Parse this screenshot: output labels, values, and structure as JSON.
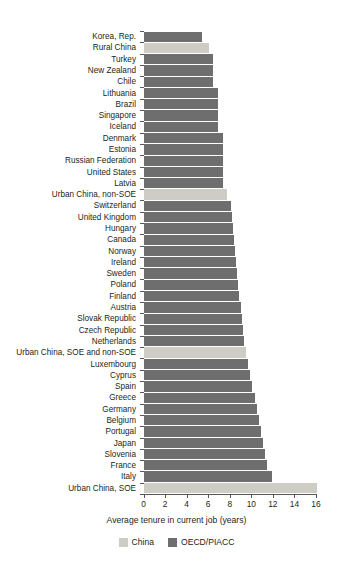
{
  "chart_data": {
    "type": "bar",
    "orientation": "horizontal",
    "title": "",
    "subtitle": "",
    "xlabel": "Average tenure in current job (years)",
    "ylabel": "",
    "xlim": [
      0,
      16.8
    ],
    "xticks": [
      0,
      2,
      4,
      6,
      8,
      10,
      12,
      14,
      16
    ],
    "xtick_labels": [
      "0",
      "2",
      "4",
      "6",
      "8",
      "10",
      "12",
      "14",
      "16"
    ],
    "grid": false,
    "legend_position": "bottom",
    "legend": [
      {
        "name": "China",
        "color": "#cdcdc6"
      },
      {
        "name": "OECD/PIACC",
        "color": "#6e6e6e"
      }
    ],
    "categories": [
      "Korea, Rep.",
      "Rural China",
      "Turkey",
      "New Zealand",
      "Chile",
      "Lithuania",
      "Brazil",
      "Singapore",
      "Iceland",
      "Denmark",
      "Estonia",
      "Russian Federation",
      "United States",
      "Latvia",
      "Urban China, non-SOE",
      "Switzerland",
      "United Kingdom",
      "Hungary",
      "Canada",
      "Norway",
      "Ireland",
      "Sweden",
      "Poland",
      "Finland",
      "Austria",
      "Slovak Republic",
      "Czech Republic",
      "Netherlands",
      "Urban China, SOE and non-SOE",
      "Luxembourg",
      "Cyprus",
      "Spain",
      "Greece",
      "Germany",
      "Belgium",
      "Portugal",
      "Japan",
      "Slovenia",
      "France",
      "Italy",
      "Urban China, SOE"
    ],
    "values": [
      5.4,
      6.1,
      6.4,
      6.4,
      6.4,
      6.9,
      6.9,
      6.9,
      6.9,
      7.4,
      7.4,
      7.4,
      7.4,
      7.4,
      7.7,
      8.1,
      8.2,
      8.3,
      8.4,
      8.5,
      8.6,
      8.7,
      8.8,
      8.9,
      9.0,
      9.1,
      9.2,
      9.3,
      9.5,
      9.7,
      9.9,
      10.1,
      10.3,
      10.5,
      10.7,
      10.9,
      11.1,
      11.3,
      11.5,
      11.9,
      16.1
    ],
    "series_of": [
      "OECD/PIACC",
      "China",
      "OECD/PIACC",
      "OECD/PIACC",
      "OECD/PIACC",
      "OECD/PIACC",
      "OECD/PIACC",
      "OECD/PIACC",
      "OECD/PIACC",
      "OECD/PIACC",
      "OECD/PIACC",
      "OECD/PIACC",
      "OECD/PIACC",
      "OECD/PIACC",
      "China",
      "OECD/PIACC",
      "OECD/PIACC",
      "OECD/PIACC",
      "OECD/PIACC",
      "OECD/PIACC",
      "OECD/PIACC",
      "OECD/PIACC",
      "OECD/PIACC",
      "OECD/PIACC",
      "OECD/PIACC",
      "OECD/PIACC",
      "OECD/PIACC",
      "OECD/PIACC",
      "China",
      "OECD/PIACC",
      "OECD/PIACC",
      "OECD/PIACC",
      "OECD/PIACC",
      "OECD/PIACC",
      "OECD/PIACC",
      "OECD/PIACC",
      "OECD/PIACC",
      "OECD/PIACC",
      "OECD/PIACC",
      "OECD/PIACC",
      "China"
    ]
  },
  "colors": {
    "china": "#cdcdc6",
    "oecd": "#6e6e6e",
    "axis": "#58585b",
    "text": "#231f20",
    "background": "#ffffff"
  }
}
